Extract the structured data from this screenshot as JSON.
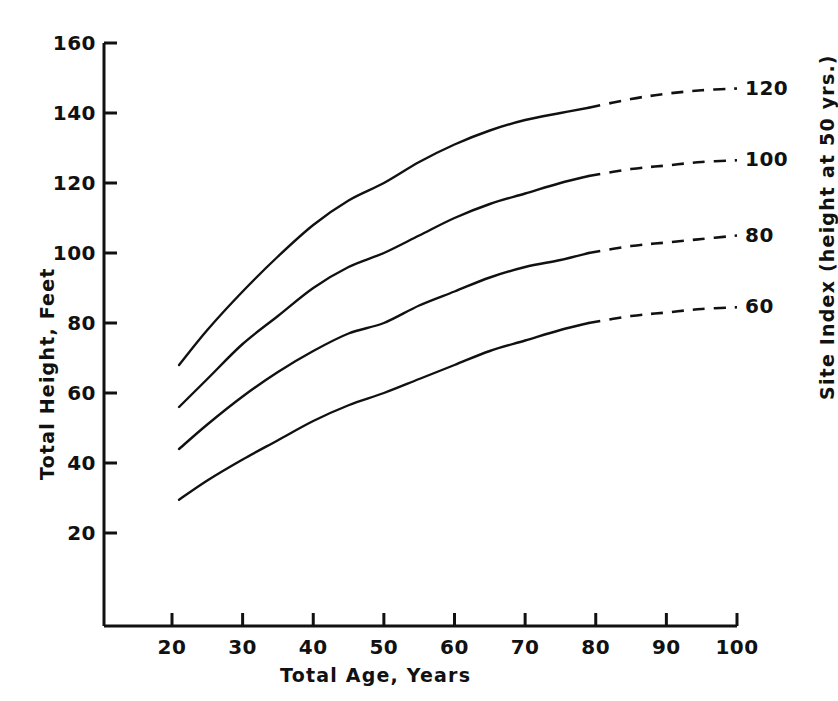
{
  "chart_data": {
    "type": "line",
    "title": "",
    "subtitle": "",
    "xlabel": "Total Age, Years",
    "ylabel": "Total Height, Feet",
    "right_axis_label": "Site Index (height at 50 yrs.)",
    "xlim": [
      10,
      100
    ],
    "ylim": [
      0,
      160
    ],
    "xticks": [
      20,
      30,
      40,
      50,
      60,
      70,
      80,
      90,
      100
    ],
    "xtick_labels": [
      "20",
      "30",
      "40",
      "50",
      "60",
      "70",
      "80",
      "90",
      "100"
    ],
    "yticks": [
      20,
      40,
      60,
      80,
      100,
      120,
      140,
      160
    ],
    "ytick_labels": [
      "20",
      "40",
      "60",
      "80",
      "100",
      "120",
      "140",
      "160"
    ],
    "grid": false,
    "legend_position": "right-axis-annotations",
    "line_color": "#111111",
    "background_color": "#ffffff",
    "solid_age_range": [
      21,
      79
    ],
    "dashed_age_range": [
      79,
      100
    ],
    "series": [
      {
        "name": "120",
        "label": "120",
        "label_x": 100,
        "label_y": 121,
        "x": [
          21,
          25,
          30,
          35,
          40,
          45,
          50,
          55,
          60,
          65,
          70,
          75,
          79,
          85,
          90,
          95,
          100
        ],
        "values": [
          68,
          78,
          89,
          99,
          108,
          115,
          120,
          126,
          131,
          135,
          138,
          140,
          141.5,
          144,
          145.5,
          146.5,
          147
        ]
      },
      {
        "name": "100",
        "label": "100",
        "label_x": 100,
        "label_y": 100,
        "x": [
          21,
          25,
          30,
          35,
          40,
          45,
          50,
          55,
          60,
          65,
          70,
          75,
          79,
          85,
          90,
          95,
          100
        ],
        "values": [
          56,
          64,
          74,
          82,
          90,
          96,
          100,
          105,
          110,
          114,
          117,
          120,
          122,
          124,
          125,
          126,
          126.5
        ]
      },
      {
        "name": "80",
        "label": "80",
        "label_x": 100,
        "label_y": 80,
        "x": [
          21,
          25,
          30,
          35,
          40,
          45,
          50,
          55,
          60,
          65,
          70,
          75,
          79,
          85,
          90,
          95,
          100
        ],
        "values": [
          44,
          51,
          59,
          66,
          72,
          77,
          80,
          85,
          89,
          93,
          96,
          98,
          100,
          102,
          103,
          104,
          105
        ]
      },
      {
        "name": "60",
        "label": "60",
        "label_x": 100,
        "label_y": 60,
        "x": [
          21,
          25,
          30,
          35,
          40,
          45,
          50,
          55,
          60,
          65,
          70,
          75,
          79,
          85,
          90,
          95,
          100
        ],
        "values": [
          29.5,
          35,
          41,
          46.5,
          52,
          56.5,
          60,
          64,
          68,
          72,
          75,
          78,
          80,
          82,
          83,
          84,
          84.5
        ]
      }
    ]
  },
  "axes": {
    "x_title": "Total Age, Years",
    "y_title": "Total Height, Feet",
    "right_title": "Site Index (height at 50 yrs.)"
  }
}
